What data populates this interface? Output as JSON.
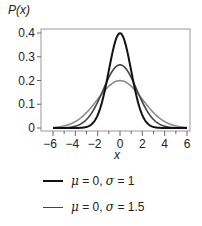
{
  "chart_data": {
    "type": "line",
    "title": "",
    "ylabel": "P(x)",
    "xlabel": "x",
    "xlim": [
      -6,
      6
    ],
    "ylim": [
      0,
      0.42
    ],
    "xticks": [
      -6,
      -4,
      -2,
      0,
      2,
      4,
      6
    ],
    "xtick_labels": [
      "−6",
      "−4",
      "−2",
      "0",
      "2",
      "4",
      "6"
    ],
    "yticks": [
      0,
      0.1,
      0.2,
      0.3,
      0.4
    ],
    "ytick_labels": [
      "0",
      "0.1",
      "0.2",
      "0.3",
      "0.4"
    ],
    "grid": false,
    "legend_position": "below",
    "series": [
      {
        "name": "μ = 0, σ = 1",
        "mu": 0,
        "sigma": 1,
        "color": "#111111",
        "width": 2,
        "in_legend": true
      },
      {
        "name": "μ = 0, σ = 1.5",
        "mu": 0,
        "sigma": 1.5,
        "color": "#444444",
        "width": 1.6,
        "in_legend": true
      },
      {
        "name": "μ = 0, σ = 2",
        "mu": 0,
        "sigma": 2,
        "color": "#8a8a8a",
        "width": 1.6,
        "in_legend": false
      }
    ]
  },
  "legend": [
    {
      "mu": "0",
      "sigma": "1",
      "color": "#111111"
    },
    {
      "mu": "0",
      "sigma": "1.5",
      "color": "#444444"
    }
  ]
}
